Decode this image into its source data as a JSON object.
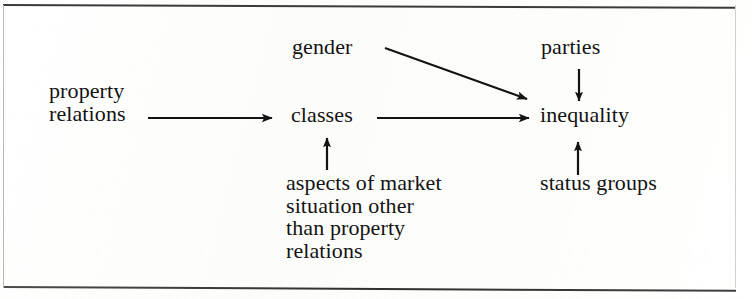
{
  "figure": {
    "type": "flow-diagram",
    "background_color": "#fdfdfc",
    "ink_color": "#131313",
    "frame": {
      "top_rule": true,
      "bottom_rule": true,
      "color": "#3b3b3b"
    }
  },
  "nodes": {
    "property_relations": "property\nrelations",
    "gender": "gender",
    "classes": "classes",
    "aspects": "aspects of market\nsituation other\nthan property\nrelations",
    "parties": "parties",
    "inequality": "inequality",
    "status_groups": "status groups"
  },
  "edges": [
    {
      "id": "property-to-classes",
      "from": "property relations",
      "to": "classes",
      "direction": "right",
      "label": ""
    },
    {
      "id": "gender-to-inequality",
      "from": "gender",
      "to": "inequality",
      "direction": "down-right",
      "label": ""
    },
    {
      "id": "classes-to-inequality",
      "from": "classes",
      "to": "inequality",
      "direction": "right",
      "label": ""
    },
    {
      "id": "aspects-to-classes",
      "from": "aspects of market situation other than property relations",
      "to": "classes",
      "direction": "up",
      "label": ""
    },
    {
      "id": "parties-to-inequality",
      "from": "parties",
      "to": "inequality",
      "direction": "down",
      "label": ""
    },
    {
      "id": "status-to-inequality",
      "from": "status groups",
      "to": "inequality",
      "direction": "up",
      "label": ""
    }
  ]
}
